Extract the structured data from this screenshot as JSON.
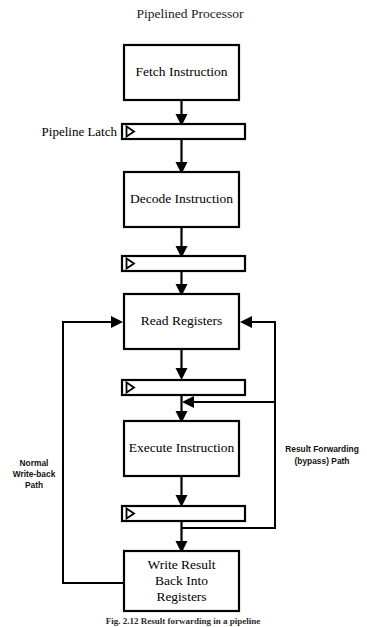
{
  "figure": {
    "title": "Pipelined Processor",
    "caption": "Fig. 2.12    Result forwarding in a pipeline",
    "background_color": "#ffffff",
    "line_color": "#000000"
  },
  "stages": [
    {
      "id": "fetch",
      "label": "Fetch Instruction"
    },
    {
      "id": "decode",
      "label": "Decode Instruction"
    },
    {
      "id": "read",
      "label": "Read Registers"
    },
    {
      "id": "execute",
      "label": "Execute Instruction"
    },
    {
      "id": "write",
      "label_line1": "Write Result",
      "label_line2": "Back Into",
      "label_line3": "Registers"
    }
  ],
  "latches": {
    "label": "Pipeline Latch",
    "count": 4
  },
  "paths": {
    "writeback": {
      "line1": "Normal",
      "line2": "Write-back",
      "line3": "Path"
    },
    "forwarding": {
      "line1": "Result Forwarding",
      "line2": "(bypass) Path"
    }
  }
}
